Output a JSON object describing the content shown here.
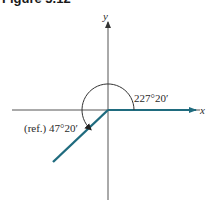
{
  "figure": {
    "title": "Figure 5.12",
    "axes": {
      "x_label": "x",
      "y_label": "y"
    },
    "angle": {
      "label": "227°20′",
      "degrees": 227.333
    },
    "reference_angle": {
      "label": "(ref.) 47°20′",
      "degrees": 47.333
    },
    "colors": {
      "axis": "#555555",
      "ray": "#1f6b7e",
      "arc": "#333333",
      "text": "#2b2b2b"
    }
  }
}
